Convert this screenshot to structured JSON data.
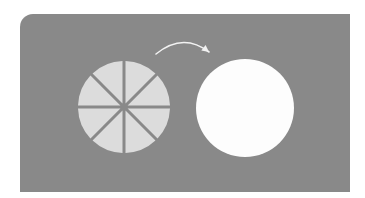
{
  "diagram": {
    "colors": {
      "page_background": "#ffffff",
      "panel_background": "#898989",
      "slice_fill": "#dcdcdc",
      "whole_circle_fill": "#fdfdfd",
      "arrow_stroke": "#f2f2f2"
    },
    "sliced_circle": {
      "cx": 124,
      "cy": 107,
      "r": 46,
      "slices": 8,
      "gap_px": 3
    },
    "whole_circle": {
      "cx": 245,
      "cy": 108,
      "r": 49
    },
    "arrow": {
      "from": [
        156,
        54
      ],
      "control": [
        183,
        32
      ],
      "to": [
        209,
        52
      ],
      "direction": "left-to-right"
    }
  }
}
